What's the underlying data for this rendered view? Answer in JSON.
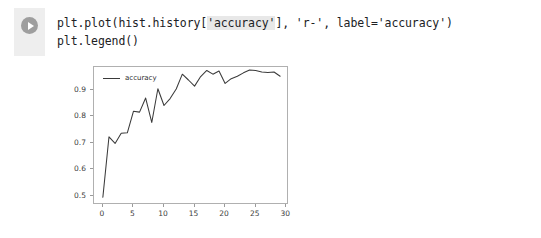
{
  "cell": {
    "run_icon": "play-icon",
    "code_lines": [
      {
        "parts": [
          {
            "text": "plt.plot(hist.history[",
            "hl": false
          },
          {
            "text": "'accuracy'",
            "hl": true
          },
          {
            "text": "], 'r-', label='accuracy')",
            "hl": false
          }
        ]
      },
      {
        "parts": [
          {
            "text": "plt.legend()",
            "hl": false
          }
        ]
      }
    ],
    "line1_full": "plt.plot(hist.history['accuracy'], 'r-', label='accuracy')",
    "line2_full": "plt.legend()"
  },
  "chart_data": {
    "type": "line",
    "title": "",
    "xlabel": "",
    "ylabel": "",
    "xlim": [
      -1.45,
      30.45
    ],
    "ylim": [
      0.465,
      0.985
    ],
    "grid": false,
    "legend_position": "upper left",
    "xticks": [
      0,
      5,
      10,
      15,
      20,
      25,
      30
    ],
    "xtick_labels": [
      "0",
      "5",
      "10",
      "15",
      "20",
      "25",
      "30"
    ],
    "yticks": [
      0.5,
      0.6,
      0.7,
      0.8,
      0.9
    ],
    "ytick_labels": [
      "0.5",
      "0.6",
      "0.7",
      "0.8",
      "0.9"
    ],
    "line_color": "#3a3a3a",
    "series": [
      {
        "name": "accuracy",
        "x": [
          0,
          1,
          2,
          3,
          4,
          5,
          6,
          7,
          8,
          9,
          10,
          11,
          12,
          13,
          14,
          15,
          16,
          17,
          18,
          19,
          20,
          21,
          22,
          23,
          24,
          25,
          26,
          27,
          28,
          29
        ],
        "values": [
          0.494,
          0.722,
          0.697,
          0.735,
          0.737,
          0.818,
          0.815,
          0.868,
          0.776,
          0.903,
          0.84,
          0.866,
          0.902,
          0.958,
          0.936,
          0.913,
          0.949,
          0.972,
          0.958,
          0.97,
          0.923,
          0.941,
          0.95,
          0.963,
          0.974,
          0.972,
          0.966,
          0.964,
          0.966,
          0.95
        ]
      }
    ]
  },
  "colors": {
    "gutter": "#eeeeee",
    "run_button": "#9e9e9e",
    "axes_border": "#b0b0b0",
    "text": "#202124",
    "tick_text": "#3c3c3c"
  }
}
